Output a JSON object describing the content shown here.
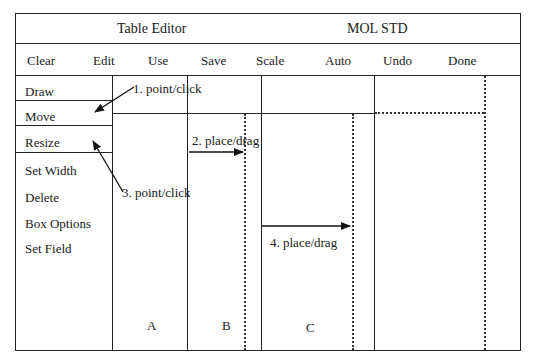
{
  "header": {
    "title": "Table Editor",
    "subtitle": "MOL STD"
  },
  "menubar": {
    "items": [
      {
        "label": "Clear"
      },
      {
        "label": "Edit"
      },
      {
        "label": "Use"
      },
      {
        "label": "Save"
      },
      {
        "label": "Scale"
      },
      {
        "label": "Auto"
      },
      {
        "label": "Undo"
      },
      {
        "label": "Done"
      }
    ]
  },
  "sidebar": {
    "items": [
      {
        "label": "Draw"
      },
      {
        "label": "Move"
      },
      {
        "label": "Resize"
      },
      {
        "label": "Set Width"
      },
      {
        "label": "Delete"
      },
      {
        "label": "Box Options"
      },
      {
        "label": "Set Field"
      }
    ]
  },
  "columns": {
    "labels": [
      "A",
      "B",
      "C"
    ]
  },
  "annotations": {
    "step1": "1. point/click",
    "step2": "2. place/drag",
    "step3": "3. point/click",
    "step4": "4. place/drag"
  }
}
